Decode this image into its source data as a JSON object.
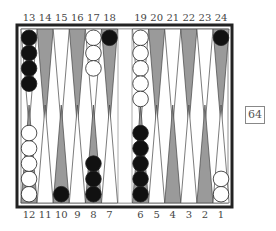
{
  "board": {
    "top_labels": [
      "13",
      "14",
      "15",
      "16",
      "17",
      "18",
      "19",
      "20",
      "21",
      "22",
      "23",
      "24"
    ],
    "bottom_labels": [
      "12",
      "11",
      "10",
      "9",
      "8",
      "7",
      "6",
      "5",
      "4",
      "3",
      "2",
      "1"
    ],
    "points": {
      "13": {
        "color": "black",
        "count": 4
      },
      "17": {
        "color": "white",
        "count": 3
      },
      "18": {
        "color": "black",
        "count": 1
      },
      "19": {
        "color": "white",
        "count": 5
      },
      "24": {
        "color": "black",
        "count": 1
      },
      "12": {
        "color": "white",
        "count": 5
      },
      "10": {
        "color": "black",
        "count": 1
      },
      "8": {
        "color": "black",
        "count": 3
      },
      "6": {
        "color": "black",
        "count": 5
      },
      "1": {
        "color": "white",
        "count": 2
      }
    },
    "colors": {
      "frame": "#222222",
      "dark_point": "#9a9a9a",
      "light_point": "#ffffff",
      "black_checker": "#111111",
      "white_checker": "#ffffff"
    }
  },
  "cube": {
    "value": "64"
  }
}
